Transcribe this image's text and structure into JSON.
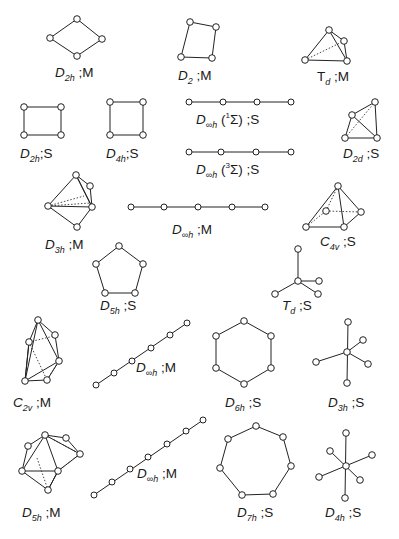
{
  "figure": {
    "items": [
      {
        "id": "d2h-m",
        "group": "D",
        "sub": "2h",
        "state": "M",
        "label": "D2h ;M"
      },
      {
        "id": "d2-m",
        "group": "D",
        "sub": "2",
        "state": "M",
        "label": "D2 ;M"
      },
      {
        "id": "td-m",
        "group": "T",
        "sub": "d",
        "state": "M",
        "label": "Td ;M"
      },
      {
        "id": "d2h-s",
        "group": "D",
        "sub": "2h",
        "state": "S",
        "label": "D2h ;S"
      },
      {
        "id": "d4h-s",
        "group": "D",
        "sub": "4h",
        "state": "S",
        "label": "D4h ;S"
      },
      {
        "id": "dinfh-1sigma-s",
        "group": "D",
        "sub": "∞h",
        "term": "1",
        "termsym": "Σ",
        "state": "S",
        "label": "D∞h (1Σ) ;S"
      },
      {
        "id": "dinfh-3sigma-s",
        "group": "D",
        "sub": "∞h",
        "term": "3",
        "termsym": "Σ",
        "state": "S",
        "label": "D∞h (3Σ) ;S"
      },
      {
        "id": "d2d-s",
        "group": "D",
        "sub": "2d",
        "state": "S",
        "label": "D2d ;S"
      },
      {
        "id": "d3h-m",
        "group": "D",
        "sub": "3h",
        "state": "M",
        "label": "D3h ;M"
      },
      {
        "id": "dinfh-m-5",
        "group": "D",
        "sub": "∞h",
        "state": "M",
        "label": "D∞h ;M"
      },
      {
        "id": "c4v-s",
        "group": "C",
        "sub": "4v",
        "state": "S",
        "label": "C4v ;S"
      },
      {
        "id": "d5h-s",
        "group": "D",
        "sub": "5h",
        "state": "S",
        "label": "D5h ;S"
      },
      {
        "id": "td-s",
        "group": "T",
        "sub": "d",
        "state": "S",
        "label": "Td ;S"
      },
      {
        "id": "c2v-m",
        "group": "C",
        "sub": "2v",
        "state": "M",
        "label": "C2v ;M"
      },
      {
        "id": "dinfh-m-6",
        "group": "D",
        "sub": "∞h",
        "state": "M",
        "label": "D∞h ;M"
      },
      {
        "id": "d6h-s",
        "group": "D",
        "sub": "6h",
        "state": "S",
        "label": "D6h ;S"
      },
      {
        "id": "d3h-s",
        "group": "D",
        "sub": "3h",
        "state": "S",
        "label": "D3h ;S"
      },
      {
        "id": "d5h-m",
        "group": "D",
        "sub": "5h",
        "state": "M",
        "label": "D5h ;M"
      },
      {
        "id": "dinfh-m-7",
        "group": "D",
        "sub": "∞h",
        "state": "M",
        "label": "D∞h ;M"
      },
      {
        "id": "d7h-s",
        "group": "D",
        "sub": "7h",
        "state": "S",
        "label": "D7h ;S"
      },
      {
        "id": "d4h-s-star",
        "group": "D",
        "sub": "4h",
        "state": "S",
        "label": "D4h ;S"
      }
    ],
    "sep": ";"
  }
}
